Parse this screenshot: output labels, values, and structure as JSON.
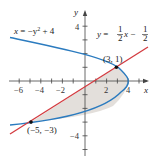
{
  "diagram": {
    "axes": {
      "x_label": "x",
      "y_label": "y",
      "x_ticks": [
        "−6",
        "−4",
        "−2",
        "2",
        "4"
      ],
      "y_ticks": [
        "4",
        "−4"
      ]
    },
    "curves": [
      {
        "name": "parabola",
        "equation_label": "x = −y² + 4",
        "color": "#2b7bbf"
      },
      {
        "name": "line",
        "equation_label": "y = ½x − ½",
        "color": "#d33a3f"
      }
    ],
    "points": [
      {
        "label": "(3, 1)",
        "x": 3,
        "y": 1
      },
      {
        "label": "(−5, −3)",
        "x": -5,
        "y": -3
      }
    ],
    "region_fill": "#e3dfdb",
    "labels": {
      "parabola_x": "x",
      "parabola_rest": " = −y",
      "parabola_exp": "2",
      "parabola_tail": " + 4",
      "line_y": "y",
      "line_eq": " = ",
      "line_x": "x",
      "line_minus": " − ",
      "frac_num": "1",
      "frac_den": "2",
      "point_a": "(3, 1)",
      "point_b": "(−5, −3)"
    }
  }
}
